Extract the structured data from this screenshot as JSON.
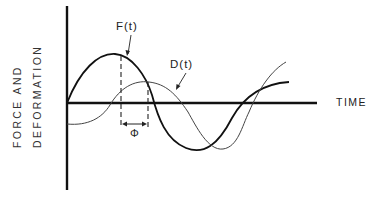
{
  "diagram": {
    "y_axis_label_line1": "FORCE AND",
    "y_axis_label_line2": "DEFORMATION",
    "x_axis_label": "TIME",
    "curve_force_label": "F(t)",
    "curve_deformation_label": "D(t)",
    "phase_label": "Φ",
    "colors": {
      "axis": "#111111",
      "force_curve": "#111111",
      "deformation_curve": "#444444",
      "text": "#222222"
    }
  }
}
